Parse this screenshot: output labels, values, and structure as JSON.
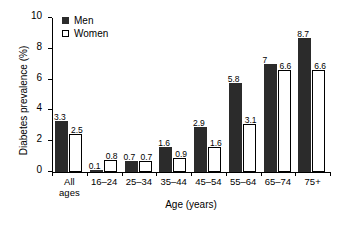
{
  "chart_data": {
    "type": "bar",
    "title": "",
    "xlabel": "Age (years)",
    "ylabel": "Diabetes prevalence (%)",
    "ylim": [
      0,
      10
    ],
    "yticks": [
      0,
      2,
      4,
      6,
      8,
      10
    ],
    "ytick_labels": [
      "0",
      "2",
      "4",
      "6",
      "8",
      "10"
    ],
    "grid": false,
    "legend_position": "top-left",
    "categories": [
      "All ages",
      "16–24",
      "25–34",
      "35–44",
      "45–54",
      "55–64",
      "65–74",
      "75+"
    ],
    "category_lines": [
      [
        "All",
        "ages"
      ],
      [
        "16–24"
      ],
      [
        "25–34"
      ],
      [
        "35–44"
      ],
      [
        "45–54"
      ],
      [
        "55–64"
      ],
      [
        "65–74"
      ],
      [
        "75+"
      ]
    ],
    "series": [
      {
        "name": "Men",
        "color": "#2b2b2b",
        "values": [
          3.3,
          0.1,
          0.7,
          1.6,
          2.9,
          5.8,
          7,
          8.7
        ],
        "labels": [
          "3.3",
          "0.1",
          "0.7",
          "1.6",
          "2.9",
          "5.8",
          "7",
          "8.7"
        ]
      },
      {
        "name": "Women",
        "color": "#ffffff",
        "values": [
          2.5,
          0.8,
          0.7,
          0.9,
          1.6,
          3.1,
          6.6,
          6.6
        ],
        "labels": [
          "2.5",
          "0.8",
          "0.7",
          "0.9",
          "1.6",
          "3.1",
          "6.6",
          "6.6"
        ]
      }
    ]
  },
  "legend": {
    "items": [
      {
        "label": "Men",
        "marker": "filled-square",
        "color": "#2b2b2b"
      },
      {
        "label": "Women",
        "marker": "open-square",
        "color": "#ffffff"
      }
    ]
  }
}
